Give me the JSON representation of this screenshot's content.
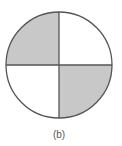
{
  "figure": {
    "caption": "(b)",
    "circle": {
      "cx": 59,
      "cy": 65,
      "r": 53
    },
    "quadrants": [
      {
        "position": "top-left",
        "shaded": true
      },
      {
        "position": "top-right",
        "shaded": false
      },
      {
        "position": "bottom-left",
        "shaded": false
      },
      {
        "position": "bottom-right",
        "shaded": true
      }
    ],
    "colors": {
      "shade": "#c8c8c8",
      "stroke": "#555555",
      "background": "#ffffff"
    }
  }
}
